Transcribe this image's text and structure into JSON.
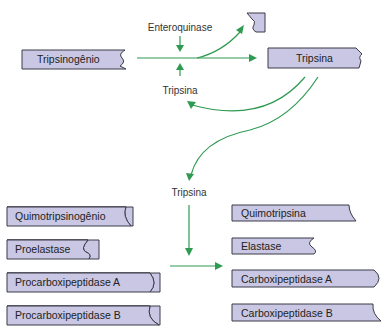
{
  "diagram": {
    "colors": {
      "box_fill": "#c9c7e3",
      "box_stroke": "#3b3b48",
      "arrow": "#2f9a52"
    },
    "activation": {
      "zymogen": "Tripsinogênio",
      "activator": "Enteroquinase",
      "autocatalyst": "Tripsina",
      "product": "Tripsina",
      "fragment": "peptide-fragment"
    },
    "cascade": {
      "catalyst": "Tripsina",
      "zymogens": [
        "Quimotripsinogênio",
        "Proelastase",
        "Procarboxipeptidase A",
        "Procarboxipeptidase B"
      ],
      "enzymes": [
        "Quimotripsina",
        "Elastase",
        "Carboxipeptidase A",
        "Carboxipeptidase B"
      ]
    }
  }
}
